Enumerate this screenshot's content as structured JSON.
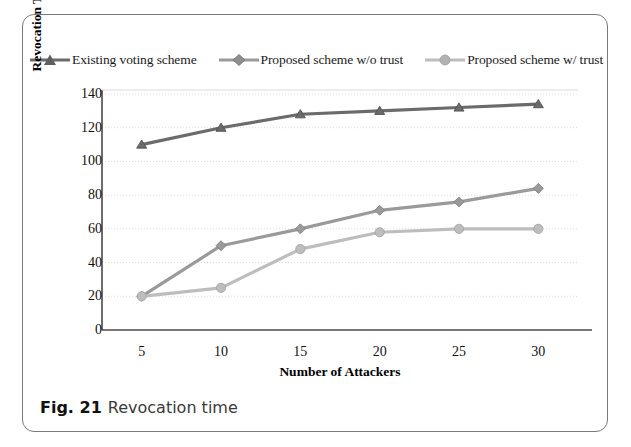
{
  "caption": {
    "figure_number": "Fig. 21",
    "text": "Revocation time"
  },
  "chart_data": {
    "type": "line",
    "title": "",
    "xlabel": "Number of Attackers",
    "ylabel": "Revocation Time (sec)",
    "x": [
      5,
      10,
      15,
      20,
      25,
      30
    ],
    "categories": [
      "5",
      "10",
      "15",
      "20",
      "25",
      "30"
    ],
    "xtick_labels": [
      "5",
      "10",
      "15",
      "20",
      "25",
      "30"
    ],
    "ytick_labels": [
      "0",
      "20",
      "40",
      "60",
      "80",
      "100",
      "120",
      "140"
    ],
    "ylim": [
      0,
      140
    ],
    "ytick_step": 20,
    "grid": true,
    "grid_axis": "y",
    "legend_position": "top",
    "series": [
      {
        "name": "Existing voting scheme",
        "marker": "triangle",
        "color": "#6b6b6b",
        "values": [
          110,
          120,
          128,
          130,
          132,
          134
        ]
      },
      {
        "name": "Proposed scheme w/o trust",
        "marker": "diamond",
        "color": "#9a9a9a",
        "values": [
          20,
          50,
          60,
          71,
          76,
          84
        ]
      },
      {
        "name": "Proposed scheme w/ trust",
        "marker": "circle",
        "color": "#bdbdbd",
        "values": [
          20,
          25,
          48,
          58,
          60,
          60
        ]
      }
    ]
  },
  "colors": {
    "frame": "#7a7a7a",
    "axis": "#4a4a4a",
    "grid": "#d8d8d8",
    "text": "#111111"
  }
}
